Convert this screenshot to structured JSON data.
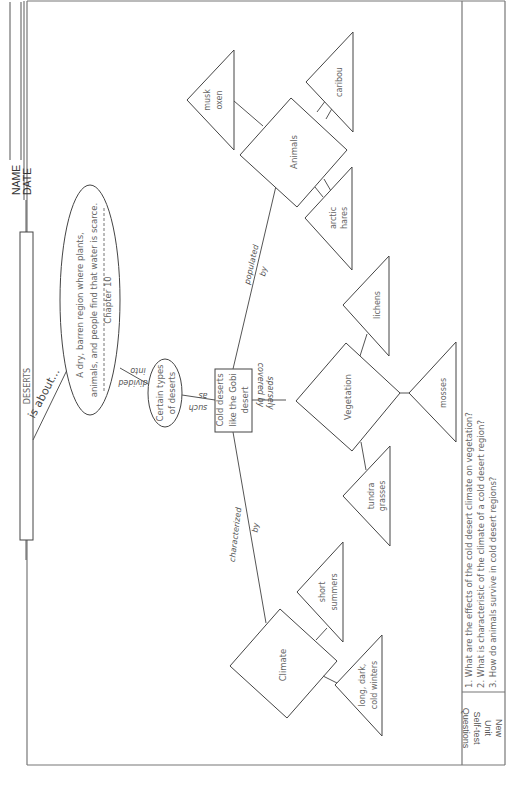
{
  "header": {
    "name_label": "NAME",
    "date_label": "DATE"
  },
  "topic": {
    "title": "DESERTS",
    "link": "is about..."
  },
  "definition": {
    "line1": "A dry, barren region where plants,",
    "line2": "animals, and people find that water is scarce.",
    "chapter": "Chapter 10"
  },
  "links": {
    "divided": "divided",
    "into": "into",
    "such": "such",
    "as": "as",
    "characterized": "characterized",
    "characterized_by": "by",
    "sparsely": "sparsely",
    "covered_by": "covered by",
    "populated": "populated",
    "populated_by": "by"
  },
  "nodes": {
    "types": {
      "line1": "Certain types",
      "line2": "of deserts"
    },
    "cold": {
      "line1": "Cold deserts",
      "line2": "like the Gobi",
      "line3": "desert"
    },
    "climate": {
      "label": "Climate",
      "details": [
        {
          "line1": "short",
          "line2": "summers"
        },
        {
          "line1": "long, dark,",
          "line2": "cold winters"
        }
      ]
    },
    "vegetation": {
      "label": "Vegetation",
      "details": [
        {
          "line1": "tundra",
          "line2": "grasses"
        },
        {
          "line1": "mosses",
          "line2": ""
        },
        {
          "line1": "lichens",
          "line2": ""
        }
      ]
    },
    "animals": {
      "label": "Animals",
      "details": [
        {
          "line1": "arctic",
          "line2": "hares"
        },
        {
          "line1": "musk",
          "line2": "oxen"
        },
        {
          "line1": "caribou",
          "line2": ""
        }
      ]
    }
  },
  "questions": {
    "section_label": [
      "New",
      "Unit",
      "Self-test",
      "Questions"
    ],
    "items": [
      "1. What are the effects of the cold desert climate on vegetation?",
      "2. What is characteristic of the climate of a cold desert region?",
      "3. How do animals survive in cold desert regions?"
    ]
  }
}
